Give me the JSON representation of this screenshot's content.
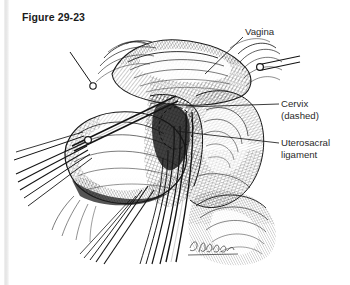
{
  "page": {
    "background_color": "#ffffff",
    "left_rule_color": "#e4e4e4"
  },
  "figure": {
    "caption": "Figure 29-23",
    "caption_color": "#1b1b1b",
    "ink_color": "#1a1a1a",
    "signature": "L. Wakelin"
  },
  "labels": [
    {
      "name": "vagina",
      "lines": [
        "Vagina"
      ],
      "line1": "Vagina",
      "line2": "",
      "leader": {
        "x1": 243,
        "y1": 37,
        "x2": 205,
        "y2": 74
      }
    },
    {
      "name": "cervix",
      "lines": [
        "Cervix",
        "(dashed)"
      ],
      "line1": "Cervix",
      "line2": "(dashed)",
      "leader": {
        "x1": 279,
        "y1": 104,
        "x2": 186,
        "y2": 107
      }
    },
    {
      "name": "uterosacral-ligament",
      "lines": [
        "Uterosacral",
        "ligament"
      ],
      "line1": "Uterosacral",
      "line2": "ligament",
      "leader": {
        "x1": 279,
        "y1": 143,
        "x2": 176,
        "y2": 131
      }
    }
  ]
}
